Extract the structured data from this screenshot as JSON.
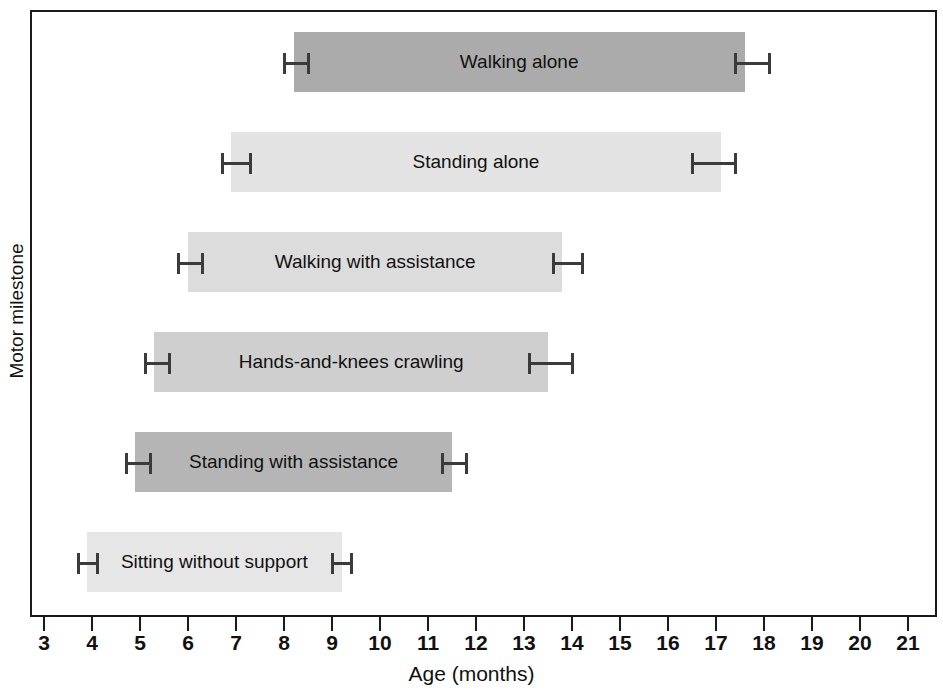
{
  "chart_data": {
    "type": "bar",
    "title": "",
    "subtitle": "",
    "xlabel": "Age (months)",
    "ylabel": "Motor milestone",
    "xlim": [
      3,
      21
    ],
    "ylim": [
      0,
      6
    ],
    "grid": false,
    "legend": "none",
    "orientation": "horizontal",
    "categories": [
      "Walking alone",
      "Standing alone",
      "Walking with assistance",
      "Hands-and-knees crawling",
      "Standing with assistance",
      "Sitting without support"
    ],
    "bars": [
      {
        "label": "Walking alone",
        "start": 8.2,
        "end": 17.6,
        "start_err_low": 8.0,
        "start_err_high": 8.5,
        "end_err_low": 17.4,
        "end_err_high": 18.1,
        "color": "#ababab"
      },
      {
        "label": "Standing alone",
        "start": 6.9,
        "end": 17.1,
        "start_err_low": 6.7,
        "start_err_high": 7.3,
        "end_err_low": 16.5,
        "end_err_high": 17.4,
        "color": "#e3e3e3"
      },
      {
        "label": "Walking with assistance",
        "start": 6.0,
        "end": 13.8,
        "start_err_low": 5.8,
        "start_err_high": 6.3,
        "end_err_low": 13.6,
        "end_err_high": 14.2,
        "color": "#dcdcdc"
      },
      {
        "label": "Hands-and-knees crawling",
        "start": 5.3,
        "end": 13.5,
        "start_err_low": 5.1,
        "start_err_high": 5.6,
        "end_err_low": 13.1,
        "end_err_high": 14.0,
        "color": "#cfcfcf"
      },
      {
        "label": "Standing with assistance",
        "start": 4.9,
        "end": 11.5,
        "start_err_low": 4.7,
        "start_err_high": 5.2,
        "end_err_low": 11.3,
        "end_err_high": 11.8,
        "color": "#b5b5b5"
      },
      {
        "label": "Sitting without support",
        "start": 3.9,
        "end": 9.2,
        "start_err_low": 3.7,
        "start_err_high": 4.1,
        "end_err_low": 9.0,
        "end_err_high": 9.4,
        "color": "#e6e6e6"
      }
    ],
    "x_ticks": [
      3,
      4,
      5,
      6,
      7,
      8,
      9,
      10,
      11,
      12,
      13,
      14,
      15,
      16,
      17,
      18,
      19,
      20,
      21
    ],
    "x_tick_labels": [
      "3",
      "4",
      "5",
      "6",
      "7",
      "8",
      "9",
      "10",
      "11",
      "12",
      "13",
      "14",
      "15",
      "16",
      "17",
      "18",
      "19",
      "20",
      "21"
    ],
    "colors": {
      "axis": "#1a1a1a",
      "error_bar": "#3b3b3b",
      "text": "#111111",
      "background": "#ffffff"
    }
  },
  "axes": {
    "x_title": "Age (months)",
    "y_title": "Motor milestone"
  }
}
